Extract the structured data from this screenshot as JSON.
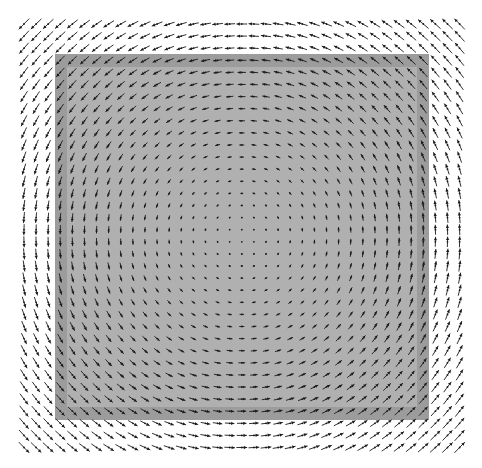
{
  "chart_data": {
    "type": "quiver",
    "title": "",
    "xlabel": "",
    "ylabel": "",
    "grid": false,
    "legend": null,
    "field": "rotational (counterclockwise vortex centered in plot); magnitude grows linearly with distance from center",
    "grid_points": {
      "x_start": 24,
      "x_step": 12.1,
      "cols": 37,
      "y_start": 24,
      "y_step": 12.1,
      "rows": 36
    },
    "center": [
      242,
      236
    ],
    "arrow_scale": 0.047,
    "arrow_color": "#1a1a1a",
    "regions": [
      {
        "name": "outer-band",
        "x": 55,
        "y": 54,
        "width": 374,
        "height": 366,
        "color": "#9c9c9c"
      },
      {
        "name": "inner-area",
        "x": 67,
        "y": 67,
        "width": 350,
        "height": 340,
        "color": "#b0b0b0"
      }
    ]
  },
  "colors": {
    "background": "#ffffff"
  }
}
